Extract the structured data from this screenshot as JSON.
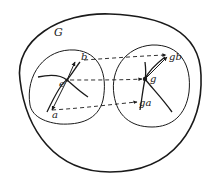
{
  "diagram": {
    "group_label": "G",
    "left_region": {
      "labels": {
        "a": "a",
        "b": "b",
        "e": "e"
      }
    },
    "right_region": {
      "labels": {
        "ga": "ga",
        "gb": "gb",
        "g": "g"
      }
    },
    "colors": {
      "ink": "#1a1a1a",
      "background": "#ffffff"
    }
  }
}
